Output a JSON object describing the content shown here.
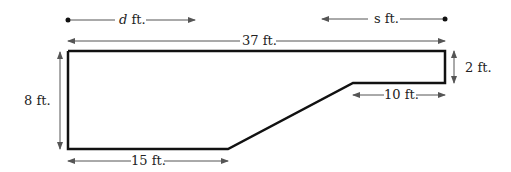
{
  "diagram": {
    "title": "",
    "labels": {
      "d_var": "d",
      "s_var": "s",
      "unit": " ft.",
      "top_width": "37 ft.",
      "left_height": "8 ft.",
      "right_height": "2 ft.",
      "step_width": "10 ft.",
      "bottom_width": "15 ft."
    },
    "dimensions": {
      "total_width_ft": 37,
      "left_height_ft": 8,
      "right_height_ft": 2,
      "step_width_ft": 10,
      "bottom_width_ft": 15
    },
    "colors": {
      "outline": "#111111",
      "arrows": "#555555",
      "text": "#222222"
    }
  }
}
